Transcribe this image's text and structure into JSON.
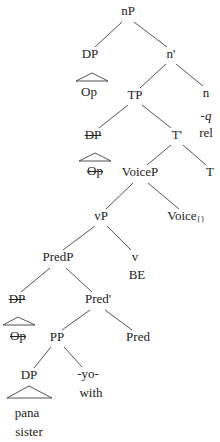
{
  "diagram": {
    "type": "syntax-tree",
    "background_color": "#ffffff",
    "text_color": "#222222",
    "line_color": "#3f3f3f",
    "nodes": {
      "nP": {
        "label": "nP"
      },
      "DP_rel": {
        "label": "DP"
      },
      "Op_rel": {
        "label": "Op"
      },
      "n_bar": {
        "label": "n'"
      },
      "TP": {
        "label": "TP"
      },
      "n": {
        "label": "n"
      },
      "n_affix": {
        "label": "-q"
      },
      "n_gloss": {
        "label": "rel"
      },
      "DP_subj": {
        "label": "DP",
        "struck": true
      },
      "T_bar": {
        "label": "T'"
      },
      "Op_subj": {
        "label": "Op",
        "struck": true
      },
      "VoiceP": {
        "label": "VoiceP"
      },
      "T": {
        "label": "T"
      },
      "vP": {
        "label": "vP"
      },
      "Voice": {
        "label": "Voice",
        "subscript": "{}"
      },
      "PredP": {
        "label": "PredP"
      },
      "v": {
        "label": "v"
      },
      "v_gloss": {
        "label": "BE"
      },
      "DP_pred": {
        "label": "DP",
        "struck": true
      },
      "Pred_bar": {
        "label": "Pred'"
      },
      "Op_pred": {
        "label": "Op",
        "struck": true
      },
      "PP": {
        "label": "PP"
      },
      "Pred": {
        "label": "Pred"
      },
      "DP_compl": {
        "label": "DP"
      },
      "P_head": {
        "label": "-yo-"
      },
      "P_gloss": {
        "label": "with"
      },
      "DP_word": {
        "label": "pana"
      },
      "DP_word_gloss": {
        "label": "sister"
      }
    }
  }
}
